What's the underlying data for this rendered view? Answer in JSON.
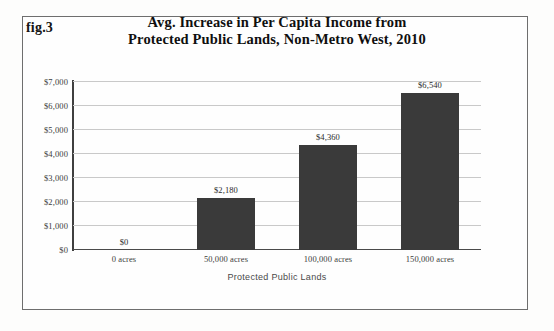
{
  "figure": {
    "number_label": "fig.3",
    "title_line1": "Avg. Increase in Per Capita Income from",
    "title_line2": "Protected Public Lands, Non-Metro West, 2010"
  },
  "chart_data": {
    "type": "bar",
    "title": "Avg. Increase in Per Capita Income from Protected Public Lands, Non-Metro West, 2010",
    "subtitle": "",
    "xlabel": "Protected Public Lands",
    "ylabel": "",
    "categories": [
      "0 acres",
      "50,000 acres",
      "100,000 acres",
      "150,000 acres"
    ],
    "values": [
      0,
      2180,
      4360,
      6540
    ],
    "value_labels": [
      "$0",
      "$2,180",
      "$4,360",
      "$6,540"
    ],
    "ylim": [
      0,
      7000
    ],
    "ytick_values": [
      0,
      1000,
      2000,
      3000,
      4000,
      5000,
      6000,
      7000
    ],
    "ytick_labels": [
      "$0",
      "$1,000",
      "$2,000",
      "$3,000",
      "$4,000",
      "$5,000",
      "$6,000",
      "$7,000"
    ],
    "grid": true,
    "legend": false,
    "bar_color": "#3a3a3a",
    "gridline_color": "#c9c9c9",
    "axis_color": "#3f3f3f"
  }
}
